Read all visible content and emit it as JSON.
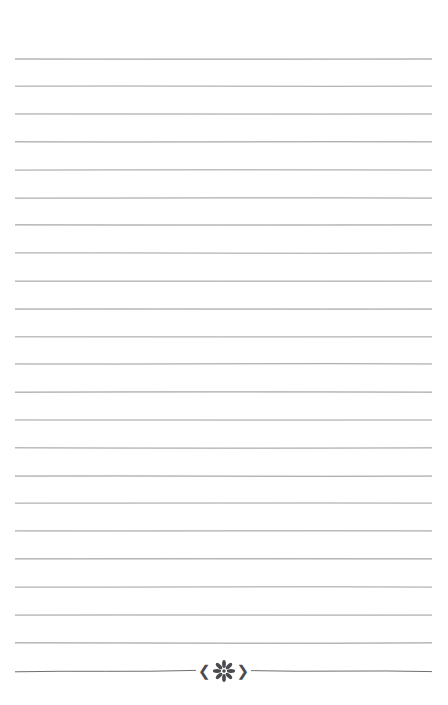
{
  "page": {
    "width": 448,
    "height": 705,
    "background_color": "#ffffff",
    "kind": "ruled-notebook-page"
  },
  "rules": {
    "count": 23,
    "line_color": "#8a8a90",
    "line_thickness_px": 1,
    "first_line_y": 59,
    "line_spacing_px": 27.8,
    "left_x": 15,
    "right_x": 432,
    "positions_y": [
      59,
      86,
      114,
      142,
      170,
      198,
      225,
      253,
      281,
      309,
      337,
      364,
      392,
      420,
      448,
      476,
      503,
      531,
      559,
      587,
      615,
      643,
      671
    ]
  },
  "ornament": {
    "name": "floral-divider",
    "on_line_index": 22,
    "left_chevron": "❮",
    "right_chevron": "❯",
    "flower_icon": "eight-petal-flower",
    "petal_count": 8,
    "color": "#4a4a4f",
    "center_x": 224,
    "center_y": 671
  }
}
